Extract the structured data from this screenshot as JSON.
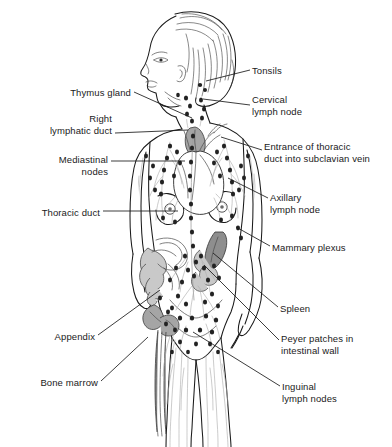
{
  "figure": {
    "background_color": "#ffffff",
    "line_color": "#1a1a1a",
    "organ_fill_color": "#9a9a9a",
    "vessel_color": "#b8b8b8",
    "node_color": "#222222",
    "width": 392,
    "height": 447
  },
  "labels": [
    {
      "id": "thymus-gland",
      "text": "Thymus gland",
      "side": "left",
      "text_x": 131,
      "text_y": 87,
      "align": "right",
      "leader": [
        [
          134,
          92
        ],
        [
          192,
          118
        ]
      ]
    },
    {
      "id": "right-lymphatic-duct",
      "text": "Right\nlymphatic duct",
      "side": "left",
      "text_x": 112,
      "text_y": 113,
      "align": "right",
      "leader": [
        [
          115,
          133
        ],
        [
          188,
          130
        ]
      ]
    },
    {
      "id": "mediastinal-nodes",
      "text": "Mediastinal\nnodes",
      "side": "left",
      "text_x": 108,
      "text_y": 154,
      "align": "right",
      "leader": [
        [
          111,
          161
        ],
        [
          185,
          161
        ]
      ]
    },
    {
      "id": "thoracic-duct",
      "text": "Thoracic duct",
      "side": "left",
      "text_x": 100,
      "text_y": 207,
      "align": "right",
      "leader": [
        [
          103,
          211
        ],
        [
          178,
          211
        ]
      ]
    },
    {
      "id": "appendix",
      "text": "Appendix",
      "side": "left",
      "text_x": 95,
      "text_y": 331,
      "align": "right",
      "leader": [
        [
          98,
          335
        ],
        [
          160,
          290
        ]
      ]
    },
    {
      "id": "bone-marrow",
      "text": "Bone marrow",
      "side": "left",
      "text_x": 98,
      "text_y": 377,
      "align": "right",
      "leader": [
        [
          101,
          381
        ],
        [
          148,
          337
        ]
      ]
    },
    {
      "id": "tonsils",
      "text": "Tonsils",
      "side": "right",
      "text_x": 252,
      "text_y": 65,
      "align": "left",
      "leader": [
        [
          250,
          70
        ],
        [
          206,
          81
        ]
      ]
    },
    {
      "id": "cervical-lymph-node",
      "text": "Cervical\nlymph node",
      "side": "right",
      "text_x": 252,
      "text_y": 94,
      "align": "left",
      "leader": [
        [
          250,
          105
        ],
        [
          203,
          99
        ]
      ]
    },
    {
      "id": "entrance-thoracic-duct",
      "text": "Entrance of thoracic\nduct into subclavian vein",
      "side": "right",
      "text_x": 264,
      "text_y": 141,
      "align": "left",
      "leader": [
        [
          262,
          150
        ],
        [
          221,
          137
        ]
      ]
    },
    {
      "id": "axillary-lymph-node",
      "text": "Axillary\nlymph node",
      "side": "right",
      "text_x": 270,
      "text_y": 192,
      "align": "left",
      "leader": [
        [
          268,
          198
        ],
        [
          228,
          178
        ]
      ]
    },
    {
      "id": "mammary-plexus",
      "text": "Mammary plexus",
      "side": "right",
      "text_x": 272,
      "text_y": 242,
      "align": "left",
      "leader": [
        [
          270,
          246
        ],
        [
          236,
          227
        ]
      ]
    },
    {
      "id": "spleen",
      "text": "Spleen",
      "side": "right",
      "text_x": 280,
      "text_y": 303,
      "align": "left",
      "leader": [
        [
          278,
          307
        ],
        [
          213,
          253
        ]
      ]
    },
    {
      "id": "peyer-patches",
      "text": "Peyer patches in\nintestinal wall",
      "side": "right",
      "text_x": 281,
      "text_y": 333,
      "align": "left",
      "leader": [
        [
          279,
          340
        ],
        [
          204,
          265
        ]
      ]
    },
    {
      "id": "inguinal-lymph-nodes",
      "text": "Inguinal\nlymph nodes",
      "side": "right",
      "text_x": 282,
      "text_y": 381,
      "align": "left",
      "leader": [
        [
          280,
          386
        ],
        [
          193,
          332
        ]
      ]
    }
  ]
}
